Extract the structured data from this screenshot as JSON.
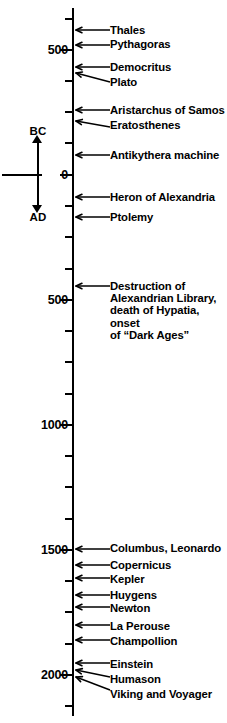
{
  "figure": {
    "axis": {
      "orientation": "vertical",
      "era_up_label": "BC",
      "era_down_label": "AD",
      "minor_tick_interval_years": 125,
      "major_tick_interval_years": 500,
      "top_year_bc": 700,
      "bottom_year_ad": 2100
    },
    "year_labels": [
      {
        "text": "500",
        "year": -500,
        "y": 50
      },
      {
        "text": "0",
        "year": 0,
        "y": 175
      },
      {
        "text": "500",
        "year": 500,
        "y": 300
      },
      {
        "text": "1000",
        "year": 1000,
        "y": 425
      },
      {
        "text": "1500",
        "year": 1500,
        "y": 550
      },
      {
        "text": "2000",
        "year": 2000,
        "y": 675
      }
    ],
    "major_ticks_y": [
      50,
      175,
      300,
      425,
      550,
      675
    ],
    "minor_ticks_y": [
      19,
      81,
      112,
      143,
      206,
      237,
      269,
      331,
      362,
      394,
      456,
      487,
      519,
      581,
      612,
      644,
      706
    ],
    "events": [
      {
        "label": "Thales",
        "tip_y": 30,
        "label_y": 24,
        "label_x": 110,
        "line_len": 34
      },
      {
        "label": "Pythagoras",
        "tip_y": 45,
        "label_y": 38,
        "label_x": 110,
        "line_len": 34
      },
      {
        "label": "Democritus",
        "tip_y": 67,
        "label_y": 61,
        "label_x": 110,
        "line_len": 34
      },
      {
        "label": "Plato",
        "tip_y": 73,
        "label_y": 76,
        "label_x": 110,
        "line_len": 34,
        "slope": 9
      },
      {
        "label": "Aristarchus of Samos",
        "tip_y": 110,
        "label_y": 104,
        "label_x": 110,
        "line_len": 34
      },
      {
        "label": "Eratosthenes",
        "tip_y": 121,
        "label_y": 119,
        "label_x": 110,
        "line_len": 34,
        "slope": 6
      },
      {
        "label": "Antikythera machine",
        "tip_y": 155,
        "label_y": 149,
        "label_x": 110,
        "line_len": 34
      },
      {
        "label": "Heron of Alexandria",
        "tip_y": 197,
        "label_y": 191,
        "label_x": 110,
        "line_len": 34
      },
      {
        "label": "Ptolemy",
        "tip_y": 217,
        "label_y": 211,
        "label_x": 110,
        "line_len": 34
      },
      {
        "label": "Destruction of\nAlexandrian Library,\ndeath of Hypatia, onset\nof “Dark Ages”",
        "tip_y": 286,
        "label_y": 280,
        "label_x": 110,
        "line_len": 34,
        "block": true
      },
      {
        "label": "Columbus, Leonardo",
        "tip_y": 549,
        "label_y": 542,
        "label_x": 110,
        "line_len": 34
      },
      {
        "label": "Copernicus",
        "tip_y": 565,
        "label_y": 559,
        "label_x": 110,
        "line_len": 34
      },
      {
        "label": "Kepler",
        "tip_y": 578,
        "label_y": 573,
        "label_x": 110,
        "line_len": 34
      },
      {
        "label": "Huygens",
        "tip_y": 595,
        "label_y": 589,
        "label_x": 110,
        "line_len": 34
      },
      {
        "label": "Newton",
        "tip_y": 607,
        "label_y": 602,
        "label_x": 110,
        "line_len": 34
      },
      {
        "label": "La Perouse",
        "tip_y": 625,
        "label_y": 620,
        "label_x": 110,
        "line_len": 34
      },
      {
        "label": "Champollion",
        "tip_y": 640,
        "label_y": 635,
        "label_x": 110,
        "line_len": 34
      },
      {
        "label": "Einstein",
        "tip_y": 663,
        "label_y": 658,
        "label_x": 110,
        "line_len": 34
      },
      {
        "label": "Humason",
        "tip_y": 670,
        "label_y": 673,
        "label_x": 110,
        "line_len": 34,
        "slope": 7
      },
      {
        "label": "Viking and Voyager",
        "tip_y": 677,
        "label_y": 688,
        "label_x": 110,
        "line_len": 34,
        "slope": 13
      }
    ]
  },
  "colors": {
    "ink": "#000000",
    "background": "#ffffff"
  }
}
